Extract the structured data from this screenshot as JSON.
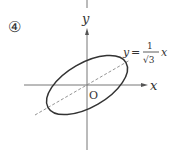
{
  "diagram": {
    "problem_number": "④",
    "axes": {
      "x_label": "x",
      "y_label": "y",
      "origin_label": "O"
    },
    "line": {
      "equation_lhs": "y",
      "equation_eq": "=",
      "fraction_numerator": "1",
      "fraction_denominator": "√3",
      "equation_var": "x",
      "style": "dashed"
    },
    "ellipse": {
      "description": "ellipse centered at origin, major axis along y = x/√3",
      "rotation_deg": 30
    },
    "colors": {
      "stroke": "#333333",
      "axis": "#666666",
      "dashed": "#888888"
    }
  }
}
